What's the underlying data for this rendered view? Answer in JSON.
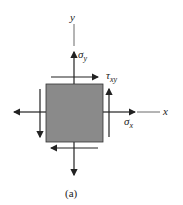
{
  "diagram": {
    "type": "plane stress element",
    "axis_labels": {
      "y": "y",
      "x": "x"
    },
    "stress_labels": {
      "sigma_y": {
        "symbol": "σ",
        "subscript": "y"
      },
      "tau_xy": {
        "symbol": "τ",
        "subscript": "xy"
      },
      "sigma_x": {
        "symbol": "σ",
        "subscript": "x"
      }
    },
    "caption": "(a)",
    "colors": {
      "element_fill": "#8a8a8a",
      "line": "#222222",
      "background": "#ffffff"
    }
  }
}
